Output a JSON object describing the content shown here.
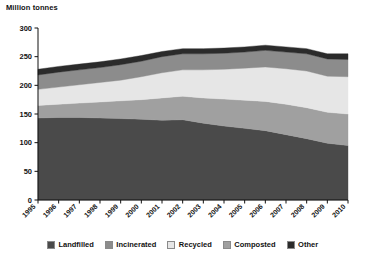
{
  "chart_data": {
    "type": "area",
    "stacked": true,
    "title": "",
    "ylabel": "Million tonnes",
    "xlabel": "",
    "ylim": [
      0,
      300
    ],
    "ytick_values": [
      0,
      50,
      100,
      150,
      200,
      250,
      300
    ],
    "ytick_labels": [
      "0",
      "50",
      "100",
      "150",
      "200",
      "250",
      "300"
    ],
    "grid": false,
    "legend_position": "bottom",
    "categories": [
      "1995",
      "1996",
      "1997",
      "1998",
      "1999",
      "2000",
      "2001",
      "2002",
      "2003",
      "2004",
      "2005",
      "2006",
      "2007",
      "2008",
      "2009",
      "2010"
    ],
    "series": [
      {
        "name": "Landfilled",
        "color": "#4a4a4a",
        "values": [
          143,
          144,
          144,
          143,
          142,
          141,
          139,
          140,
          134,
          129,
          125,
          121,
          114,
          107,
          99,
          95
        ]
      },
      {
        "name": "Composted",
        "color": "#a0a0a0",
        "values": [
          22,
          23,
          25,
          28,
          31,
          34,
          39,
          41,
          44,
          47,
          49,
          51,
          53,
          54,
          54,
          55
        ]
      },
      {
        "name": "Recycled",
        "color": "#e6e6e6",
        "values": [
          28,
          30,
          32,
          34,
          36,
          40,
          44,
          46,
          49,
          52,
          56,
          60,
          62,
          64,
          63,
          65
        ]
      },
      {
        "name": "Incinerated",
        "color": "#8c8c8c",
        "values": [
          25,
          26,
          26,
          26,
          27,
          27,
          28,
          28,
          28,
          28,
          28,
          29,
          29,
          30,
          30,
          30
        ]
      },
      {
        "name": "Other",
        "color": "#2b2b2b",
        "values": [
          10,
          10,
          10,
          10,
          10,
          10,
          9,
          9,
          9,
          9,
          9,
          9,
          9,
          9,
          9,
          10
        ]
      }
    ],
    "legend_entries": [
      {
        "label": "Landfilled",
        "color": "#4a4a4a"
      },
      {
        "label": "Incinerated",
        "color": "#8c8c8c"
      },
      {
        "label": "Recycled",
        "color": "#e6e6e6"
      },
      {
        "label": "Composted",
        "color": "#a0a0a0"
      },
      {
        "label": "Other",
        "color": "#2b2b2b"
      }
    ],
    "series_stack_order": [
      "Landfilled",
      "Composted",
      "Recycled",
      "Incinerated",
      "Other"
    ],
    "axis_color": "#111111"
  }
}
